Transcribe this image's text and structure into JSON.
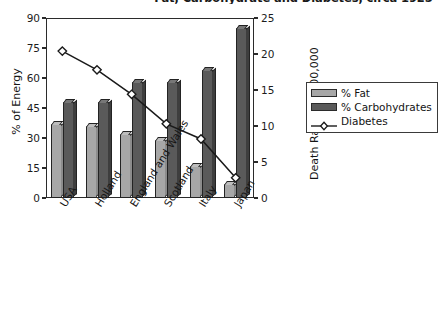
{
  "title": "Fat, Carbohydrate and Diabetes, circa 1925",
  "axes": {
    "left": {
      "label": "% of Energy",
      "ticks": [
        "0",
        "15",
        "30",
        "45",
        "60",
        "75",
        "90"
      ],
      "min": 0,
      "max": 90
    },
    "right": {
      "label": "Death Rate per 100,000",
      "ticks": [
        "0",
        "5",
        "10",
        "15",
        "20",
        "25"
      ],
      "min": 0,
      "max": 25
    }
  },
  "legend": {
    "items": [
      {
        "label": "% Fat",
        "type": "bar",
        "color": "#a7a7a7"
      },
      {
        "label": "% Carbohydrates",
        "type": "bar",
        "color": "#5a5a5a"
      },
      {
        "label": "Diabetes",
        "type": "line",
        "color": "#1a1a1a"
      }
    ]
  },
  "chart_data": {
    "type": "bar",
    "title": "Fat, Carbohydrate and Diabetes, circa 1925",
    "xlabel": "",
    "ylabel": "% of Energy",
    "y2label": "Death Rate per 100,000",
    "ylim": [
      0,
      90
    ],
    "y2lim": [
      0,
      25
    ],
    "grid": false,
    "legend_position": "right",
    "categories": [
      "USA",
      "Holland",
      "England and Wales",
      "Scotland",
      "Italy",
      "Japan"
    ],
    "series": [
      {
        "name": "% Fat",
        "axis": "left",
        "kind": "bar",
        "color": "#a7a7a7",
        "values": [
          37,
          36,
          32,
          29,
          16,
          7
        ]
      },
      {
        "name": "% Carbohydrates",
        "axis": "left",
        "kind": "bar",
        "color": "#5a5a5a",
        "values": [
          48,
          48,
          58,
          58,
          64,
          85
        ]
      },
      {
        "name": "Diabetes",
        "axis": "right",
        "kind": "line",
        "color": "#1a1a1a",
        "marker": "diamond",
        "values": [
          20.4,
          17.8,
          14.4,
          10.3,
          8.2,
          2.8
        ]
      }
    ]
  }
}
